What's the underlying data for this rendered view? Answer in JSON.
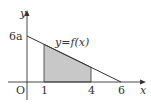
{
  "diagram": {
    "function_label": "y=f(x)",
    "axes": {
      "x_label": "x",
      "y_label": "y",
      "origin_label": "O"
    },
    "y_intercept_label": "6a",
    "x_tick_labels": [
      "1",
      "4",
      "6"
    ],
    "line": {
      "from": [
        0,
        "6a"
      ],
      "to": [
        6,
        0
      ]
    },
    "shaded_region": {
      "x_from": 1,
      "x_to": 4,
      "color": "#c8c8c8"
    },
    "colors": {
      "line": "#333333",
      "axis": "#333333",
      "shade": "#c8c8c8"
    }
  }
}
